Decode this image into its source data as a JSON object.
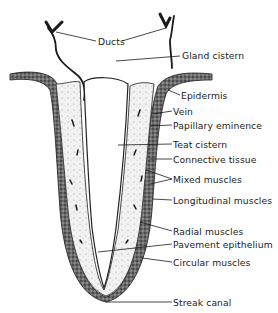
{
  "diagram": {
    "labels": [
      {
        "id": "ducts",
        "text": "Ducts",
        "x": 98,
        "y": 36
      },
      {
        "id": "gland-cistern",
        "text": "Gland cistern",
        "x": 182,
        "y": 50
      },
      {
        "id": "epidermis",
        "text": "Epidermis",
        "x": 181,
        "y": 90
      },
      {
        "id": "vein",
        "text": "Vein",
        "x": 173,
        "y": 106
      },
      {
        "id": "papillary-eminence",
        "text": "Papillary eminence",
        "x": 173,
        "y": 120
      },
      {
        "id": "teat-cistern",
        "text": "Teat cistern",
        "x": 173,
        "y": 139
      },
      {
        "id": "connective-tissue",
        "text": "Connective tissue",
        "x": 173,
        "y": 154
      },
      {
        "id": "mixed-muscles",
        "text": "Mixed muscles",
        "x": 173,
        "y": 174
      },
      {
        "id": "longitudinal-muscles",
        "text": "Longitudinal muscles",
        "x": 173,
        "y": 195
      },
      {
        "id": "radial-muscles",
        "text": "Radial muscles",
        "x": 173,
        "y": 226
      },
      {
        "id": "pavement-epithelium",
        "text": "Pavement epithelium",
        "x": 173,
        "y": 239
      },
      {
        "id": "circular-muscles",
        "text": "Circular muscles",
        "x": 173,
        "y": 257
      },
      {
        "id": "streak-canal",
        "text": "Streak canal",
        "x": 173,
        "y": 297
      }
    ],
    "colors": {
      "ink": "#1a1a1a",
      "tissue": "#4a4a4a",
      "background": "#ffffff"
    }
  }
}
